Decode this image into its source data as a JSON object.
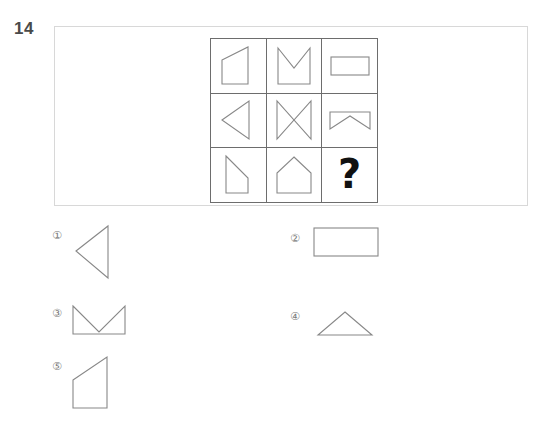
{
  "question": {
    "number": "14",
    "missing_cell_symbol": "?"
  },
  "matrix": {
    "rows": 3,
    "columns": 3,
    "cells": [
      {
        "position": "r1c1",
        "shape_name": "right-trapezoid-slanted-top-left",
        "is_missing": false
      },
      {
        "position": "r1c2",
        "shape_name": "square-with-top-v-notch",
        "is_missing": false
      },
      {
        "position": "r1c3",
        "shape_name": "horizontal-rectangle",
        "is_missing": false
      },
      {
        "position": "r2c1",
        "shape_name": "left-pointing-triangle",
        "is_missing": false
      },
      {
        "position": "r2c2",
        "shape_name": "bowtie-hourglass",
        "is_missing": false
      },
      {
        "position": "r2c3",
        "shape_name": "rectangle-with-bottom-v-notch",
        "is_missing": false
      },
      {
        "position": "r3c1",
        "shape_name": "quadrilateral-slanted-top-right",
        "is_missing": false
      },
      {
        "position": "r3c2",
        "shape_name": "house-pentagon",
        "is_missing": false
      },
      {
        "position": "r3c3",
        "shape_name": "missing-answer-cell",
        "is_missing": true
      }
    ]
  },
  "options": [
    {
      "id": "1",
      "label": "①",
      "shape_name": "left-pointing-triangle"
    },
    {
      "id": "2",
      "label": "②",
      "shape_name": "horizontal-rectangle"
    },
    {
      "id": "3",
      "label": "③",
      "shape_name": "rectangle-with-top-v-notch"
    },
    {
      "id": "4",
      "label": "④",
      "shape_name": "upward-pointing-triangle"
    },
    {
      "id": "5",
      "label": "⑤",
      "shape_name": "quadrilateral-slanted-top-left"
    }
  ],
  "colors": {
    "shape_stroke": "#888888",
    "grid_line": "#6d6d6d",
    "frame_border": "#d8d8d8",
    "number_text": "#4a4a4a",
    "option_label_text": "#7a7a7a",
    "question_mark": "#111111",
    "background": "#ffffff"
  }
}
